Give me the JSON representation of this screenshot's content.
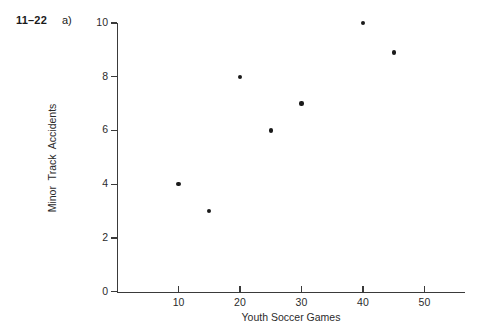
{
  "problem": {
    "number": "11–22",
    "part": "a)"
  },
  "chart_data": {
    "type": "scatter",
    "title": "",
    "xlabel": "Youth Soccer Games",
    "ylabel": "Minor Track Accidents",
    "xlim": [
      0,
      56.6
    ],
    "ylim": [
      0,
      10
    ],
    "grid": false,
    "legend": null,
    "xticks": [
      10,
      20,
      30,
      40,
      50
    ],
    "yticks": [
      0,
      2,
      4,
      6,
      8,
      10
    ],
    "xtick_labels": [
      "10",
      "20",
      "30",
      "40",
      "50"
    ],
    "ytick_labels": [
      "0",
      "2",
      "4",
      "6",
      "8",
      "10"
    ],
    "points": [
      {
        "x": 10,
        "y": 4
      },
      {
        "x": 15,
        "y": 3
      },
      {
        "x": 20,
        "y": 8
      },
      {
        "x": 25,
        "y": 6
      },
      {
        "x": 30,
        "y": 7
      },
      {
        "x": 40,
        "y": 10
      },
      {
        "x": 45,
        "y": 8.9
      }
    ],
    "marker": "filled-circle",
    "marker_color": "#1a1a1a",
    "axis_color": "#3a3a3a",
    "background_color": "#ffffff"
  }
}
